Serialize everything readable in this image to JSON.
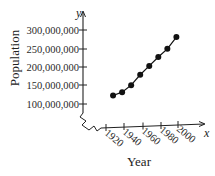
{
  "chart_data": {
    "type": "line",
    "title": "",
    "xlabel": "Year",
    "ylabel": "Population",
    "x_axis_var": "x",
    "y_axis_var": "y",
    "x": [
      1930,
      1940,
      1950,
      1960,
      1970,
      1980,
      1990,
      2000
    ],
    "series": [
      {
        "name": "Population",
        "values": [
          123000000,
          132000000,
          151000000,
          179000000,
          203000000,
          227000000,
          249000000,
          281000000
        ],
        "marker": "circle",
        "color": "#111111"
      }
    ],
    "x_ticks": [
      "1920",
      "1940",
      "1960",
      "1980",
      "2000"
    ],
    "y_ticks": [
      "100,000,000",
      "150,000,000",
      "200,000,000",
      "250,000,000",
      "300,000,000"
    ],
    "xlim": [
      1920,
      2030
    ],
    "ylim": [
      100000000,
      300000000
    ],
    "axis_break": true,
    "grid": false,
    "legend": "none"
  }
}
